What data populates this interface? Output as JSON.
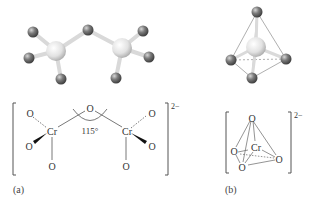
{
  "figure": {
    "panels": [
      {
        "id": "a",
        "label": "(a)",
        "description": "Dichromate ion Cr2O7 2-",
        "ball_and_stick": {
          "chromium": [
            {
              "x": 56,
              "y": 51
            },
            {
              "x": 122,
              "y": 48
            }
          ],
          "oxygen": [
            {
              "x": 33,
              "y": 32
            },
            {
              "x": 29,
              "y": 58
            },
            {
              "x": 61,
              "y": 79
            },
            {
              "x": 88,
              "y": 30
            },
            {
              "x": 143,
              "y": 31
            },
            {
              "x": 149,
              "y": 57
            },
            {
              "x": 116,
              "y": 78
            }
          ]
        },
        "formula": {
          "atoms": {
            "o_bridge": "O",
            "cr_left": "Cr",
            "cr_right": "Cr",
            "o_left_top": "O",
            "o_left_wedge": "O",
            "o_left_bottom": "O",
            "o_right_top": "O",
            "o_right_wedge": "O",
            "o_right_bottom": "O"
          },
          "angle": "115°",
          "charge": "2−"
        }
      },
      {
        "id": "b",
        "label": "(b)",
        "description": "Chromate ion CrO4 2-",
        "ball_and_stick": {
          "chromium": [
            {
              "x": 256,
              "y": 47
            }
          ],
          "oxygen": [
            {
              "x": 257,
              "y": 12
            },
            {
              "x": 231,
              "y": 60
            },
            {
              "x": 286,
              "y": 59
            },
            {
              "x": 252,
              "y": 78
            }
          ]
        },
        "formula": {
          "atoms": {
            "o_top": "O",
            "cr": "Cr",
            "o_left": "O",
            "o_right": "O",
            "o_bottom": "O"
          },
          "charge": "2−"
        }
      }
    ],
    "colors": {
      "chromium": "#e4e4e4",
      "oxygen": "#6e6e6e",
      "bond": "#d8d8d8",
      "line": "#555555"
    }
  }
}
